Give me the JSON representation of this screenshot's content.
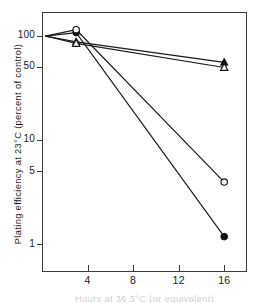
{
  "chart_data": {
    "type": "line",
    "title": "",
    "xlabel": "Hours at 36.5°C (or equivalent)",
    "ylabel": "Plating efficiency at 23°C (percent of control)",
    "xlabel_visible": false,
    "xscale": "linear",
    "yscale": "log",
    "xlim": [
      0,
      18
    ],
    "ylim": [
      0.55,
      170
    ],
    "grid": false,
    "legend": "none",
    "xticks": [
      4,
      8,
      12,
      16
    ],
    "xtick_labels": [
      "4",
      "8",
      "12",
      "16"
    ],
    "yticks": [
      100,
      50,
      10,
      5,
      1
    ],
    "ytick_labels": [
      "100",
      "50",
      "10",
      "5",
      "1"
    ],
    "series": [
      {
        "name": "filled-triangle",
        "marker": "filled-triangle",
        "x": [
          0.3,
          3,
          16
        ],
        "values": [
          100,
          88,
          56
        ]
      },
      {
        "name": "open-triangle",
        "marker": "open-triangle",
        "x": [
          0.3,
          3,
          16
        ],
        "values": [
          100,
          85,
          50
        ]
      },
      {
        "name": "filled-circle",
        "marker": "filled-circle",
        "x": [
          0.3,
          3,
          16
        ],
        "values": [
          100,
          108,
          1.2
        ]
      },
      {
        "name": "open-circle",
        "marker": "open-circle",
        "x": [
          0.3,
          3,
          16
        ],
        "values": [
          100,
          115,
          4
        ]
      }
    ]
  },
  "axis": {
    "ylabel": "Plating efficiency at 23°C (percent of control)",
    "xlabel": "Hours at 36.5°C (or equivalent)",
    "ytick_100": "100",
    "ytick_50": "50",
    "ytick_10": "10",
    "ytick_5": "5",
    "ytick_1": "1",
    "xtick_4": "4",
    "xtick_8": "8",
    "xtick_12": "12",
    "xtick_16": "16"
  },
  "colors": {
    "axis": "#3a3a3a",
    "ink": "#1a1a1a",
    "marker_fill": "#111111",
    "marker_open": "#ffffff",
    "background": "#ffffff"
  }
}
